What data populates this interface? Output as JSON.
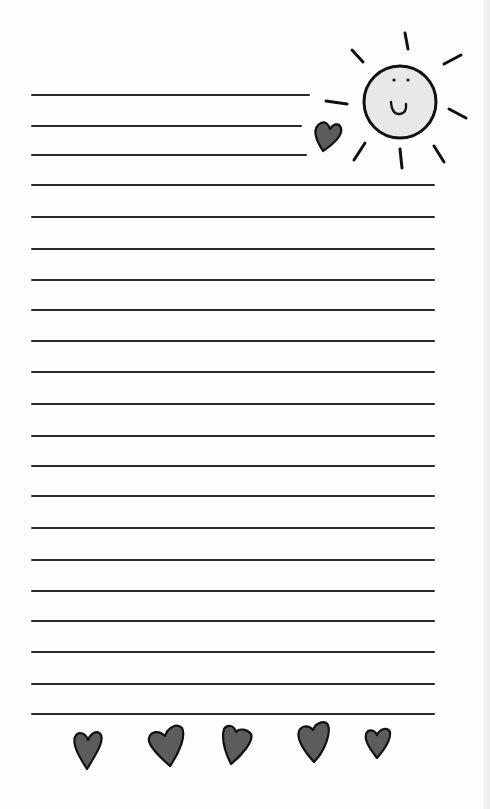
{
  "page": {
    "type": "lined-stationery",
    "title": "",
    "background": "#fefefe",
    "line_color": "#2a2a2a",
    "line_count": 21
  },
  "lines": [
    {
      "y": 95,
      "x1": 31,
      "x2": 310
    },
    {
      "y": 126,
      "x1": 31,
      "x2": 302
    },
    {
      "y": 155,
      "x1": 31,
      "x2": 307
    },
    {
      "y": 185,
      "x1": 31,
      "x2": 435
    },
    {
      "y": 217,
      "x1": 31,
      "x2": 435
    },
    {
      "y": 249,
      "x1": 31,
      "x2": 435
    },
    {
      "y": 280,
      "x1": 31,
      "x2": 435
    },
    {
      "y": 310,
      "x1": 31,
      "x2": 435
    },
    {
      "y": 341,
      "x1": 31,
      "x2": 435
    },
    {
      "y": 372,
      "x1": 31,
      "x2": 435
    },
    {
      "y": 404,
      "x1": 31,
      "x2": 435
    },
    {
      "y": 436,
      "x1": 31,
      "x2": 435
    },
    {
      "y": 466,
      "x1": 31,
      "x2": 435
    },
    {
      "y": 496,
      "x1": 31,
      "x2": 435
    },
    {
      "y": 528,
      "x1": 31,
      "x2": 435
    },
    {
      "y": 560,
      "x1": 31,
      "x2": 435
    },
    {
      "y": 591,
      "x1": 31,
      "x2": 435
    },
    {
      "y": 621,
      "x1": 31,
      "x2": 435
    },
    {
      "y": 652,
      "x1": 31,
      "x2": 435
    },
    {
      "y": 684,
      "x1": 31,
      "x2": 435
    },
    {
      "y": 714,
      "x1": 31,
      "x2": 435
    }
  ],
  "decorations": {
    "sun": {
      "icon": "smiling-sun-icon",
      "fill": "#e8e8e8",
      "stroke": "#111111",
      "cx": 400,
      "cy": 102,
      "r": 36
    },
    "top_heart": {
      "icon": "heart-icon",
      "fill": "#5c5c5c"
    },
    "bottom_hearts": [
      {
        "icon": "heart-icon",
        "fill": "#5c5c5c"
      },
      {
        "icon": "heart-icon",
        "fill": "#5c5c5c"
      },
      {
        "icon": "heart-icon",
        "fill": "#5c5c5c"
      },
      {
        "icon": "heart-icon",
        "fill": "#5c5c5c"
      },
      {
        "icon": "heart-icon",
        "fill": "#5c5c5c"
      }
    ]
  }
}
